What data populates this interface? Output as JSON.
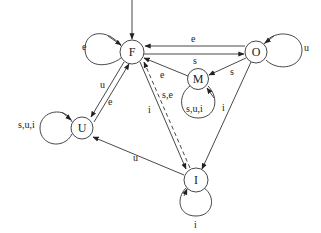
{
  "diagram": {
    "type": "state-transition",
    "nodes": [
      {
        "id": "F",
        "label": "F",
        "x": 132,
        "y": 52,
        "initial": true
      },
      {
        "id": "O",
        "label": "O",
        "x": 256,
        "y": 52
      },
      {
        "id": "M",
        "label": "M",
        "x": 198,
        "y": 79
      },
      {
        "id": "U",
        "label": "U",
        "x": 82,
        "y": 128
      },
      {
        "id": "I",
        "label": "I",
        "x": 196,
        "y": 180
      }
    ],
    "edges": [
      {
        "from": "F",
        "to": "F",
        "label": "e",
        "style": "solid"
      },
      {
        "from": "O",
        "to": "F",
        "label": "e",
        "style": "solid"
      },
      {
        "from": "F",
        "to": "O",
        "label": "s",
        "style": "solid"
      },
      {
        "from": "O",
        "to": "M",
        "label": "s",
        "style": "solid"
      },
      {
        "from": "M",
        "to": "F",
        "label": "e",
        "style": "solid"
      },
      {
        "from": "M",
        "to": "M",
        "label": "s,u,i",
        "style": "solid"
      },
      {
        "from": "O",
        "to": "O",
        "label": "u",
        "style": "solid"
      },
      {
        "from": "F",
        "to": "U",
        "label": "u",
        "style": "solid"
      },
      {
        "from": "U",
        "to": "F",
        "label": "e",
        "style": "solid"
      },
      {
        "from": "U",
        "to": "U",
        "label": "s,u,i",
        "style": "solid"
      },
      {
        "from": "F",
        "to": "I",
        "label": "i",
        "style": "solid"
      },
      {
        "from": "I",
        "to": "F",
        "label": "s,e",
        "style": "dashed"
      },
      {
        "from": "O",
        "to": "I",
        "label": "i",
        "style": "solid"
      },
      {
        "from": "I",
        "to": "U",
        "label": "u",
        "style": "solid"
      },
      {
        "from": "I",
        "to": "I",
        "label": "i",
        "style": "solid"
      }
    ]
  },
  "labels": {
    "F": "F",
    "O": "O",
    "M": "M",
    "U": "U",
    "I": "I",
    "loop_F": "e",
    "O_to_F": "e",
    "F_to_O": "s",
    "O_to_M": "s",
    "M_to_F": "e",
    "loop_M": "s,u,i",
    "loop_O": "u",
    "F_to_U": "u",
    "U_to_F": "e",
    "loop_U": "s,u,i",
    "F_to_I": "i",
    "I_to_F": "s,e",
    "O_to_I": "i",
    "I_to_U": "u",
    "loop_I": "i"
  }
}
